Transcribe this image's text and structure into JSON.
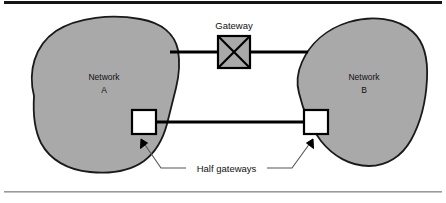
{
  "figure": {
    "title_rule_top": "thick-black-rule",
    "title_rule_bottom": "thin-gray-rule"
  },
  "diagram": {
    "type": "network-interconnection-diagram",
    "networks": [
      {
        "id": "a",
        "label_line1": "Network",
        "label_line2": "A"
      },
      {
        "id": "b",
        "label_line1": "Network",
        "label_line2": "B"
      }
    ],
    "gateway": {
      "label": "Gateway",
      "glyph": "crossed-box"
    },
    "half_gateways": {
      "label": "Half gateways",
      "count": 2
    }
  },
  "colors": {
    "network_fill": "#a9a9a9",
    "network_stroke": "#1a1a1a",
    "gateway_fill": "#a9a9a9",
    "gateway_stroke": "#000000",
    "half_gateway_fill": "#ffffff",
    "half_gateway_stroke": "#000000",
    "link_line": "#000000",
    "leader_line": "#555555",
    "rule_top": "#151515",
    "rule_bottom": "#9a9a9a",
    "text": "#111111",
    "page_background": "#ffffff"
  }
}
